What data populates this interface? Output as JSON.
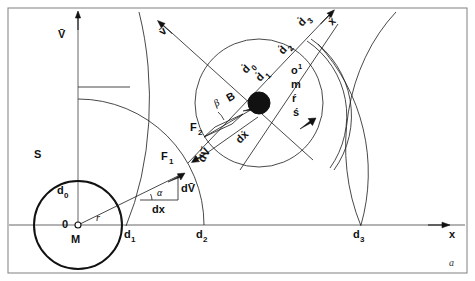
{
  "figure": {
    "corner_label": "a",
    "caption_present": false
  },
  "axes": {
    "x_axis_label": "x",
    "v_axis_label": "V̄",
    "x_prime_label": "x́"
  },
  "bodies": {
    "sphere_label": "S",
    "center_label": "M",
    "origin_label": "0",
    "radius_label": "r"
  },
  "distances": {
    "d0": "d",
    "d0_sub": "0",
    "d1": "d",
    "d1_sub": "1",
    "d2": "d",
    "d2_sub": "2",
    "d3": "d",
    "d3_sub": "3",
    "d0p": "d́",
    "d0p_sub": "0",
    "d1p": "d́",
    "d1p_sub": "1",
    "d2p": "d́",
    "d2p_sub": "2",
    "d3p": "d́",
    "d3p_sub": "3"
  },
  "vectors": {
    "v_small": "v̄",
    "dV_bar": "dV̄",
    "dV_bar_prime": "dV̄́",
    "dx": "dx",
    "dx_prime": "dx́",
    "F1": "F",
    "F1_sub": "1",
    "F2": "F",
    "F2_sub": "2",
    "B": "B"
  },
  "angles": {
    "alpha": "α",
    "beta": "β"
  },
  "particle_stack": {
    "line1": "o",
    "line1_sup": "1",
    "line2": "m",
    "line3": "ŕ",
    "line4": "ś"
  }
}
